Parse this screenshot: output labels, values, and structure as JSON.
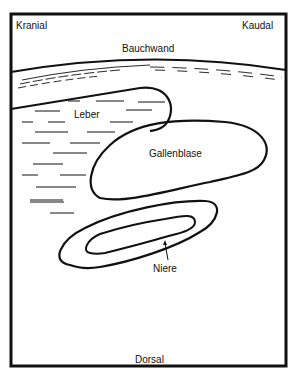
{
  "diagram": {
    "type": "anatomical-sonography-schematic",
    "orientation": {
      "top_left": "Kranial",
      "top_right": "Kaudal",
      "bottom": "Dorsal"
    },
    "structures": [
      {
        "id": "bauchwand",
        "label": "Bauchwand"
      },
      {
        "id": "leber",
        "label": "Leber"
      },
      {
        "id": "gallenblase",
        "label": "Gallenblase"
      },
      {
        "id": "niere",
        "label": "Niere"
      }
    ],
    "colors": {
      "stroke": "#111111",
      "background": "#ffffff"
    }
  }
}
